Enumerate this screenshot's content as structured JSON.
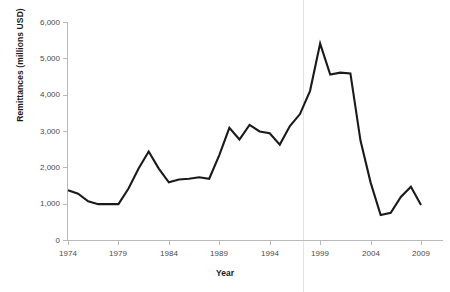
{
  "chart_data": {
    "type": "line",
    "title": "",
    "xlabel": "Year",
    "ylabel": "Remittances (millions USD)",
    "xlim": [
      1974,
      2009
    ],
    "ylim": [
      0,
      6000
    ],
    "grid": false,
    "legend": null,
    "x_ticks": [
      "1974",
      "1979",
      "1984",
      "1989",
      "1994",
      "1999",
      "2004",
      "2009"
    ],
    "x_tick_values": [
      1974,
      1979,
      1984,
      1989,
      1994,
      1999,
      2004,
      2009
    ],
    "y_ticks": [
      "0",
      "1,000",
      "2,000",
      "3,000",
      "4,000",
      "5,000",
      "6,000"
    ],
    "y_tick_values": [
      0,
      1000,
      2000,
      3000,
      4000,
      5000,
      6000
    ],
    "x": [
      1974,
      1975,
      1976,
      1977,
      1978,
      1979,
      1980,
      1981,
      1982,
      1983,
      1984,
      1985,
      1986,
      1987,
      1988,
      1989,
      1990,
      1991,
      1992,
      1993,
      1994,
      1995,
      1996,
      1997,
      1998,
      1999,
      2000,
      2001,
      2002,
      2003,
      2004,
      2005,
      2006,
      2007,
      2008,
      2009
    ],
    "series": [
      {
        "name": "Remittances",
        "color": "#1a1a1a",
        "values": [
          1380,
          1290,
          1080,
          1000,
          1000,
          1000,
          1430,
          1980,
          2450,
          1980,
          1600,
          1680,
          1700,
          1740,
          1700,
          2350,
          3100,
          2780,
          3180,
          3000,
          2950,
          2640,
          3150,
          3480,
          4120,
          5420,
          4570,
          4620,
          4600,
          2750,
          1600,
          700,
          760,
          1200,
          1480,
          980
        ]
      }
    ],
    "annotations": [
      {
        "type": "vertical-line",
        "x": 1997.3,
        "color": "#e3e3e3"
      }
    ]
  }
}
